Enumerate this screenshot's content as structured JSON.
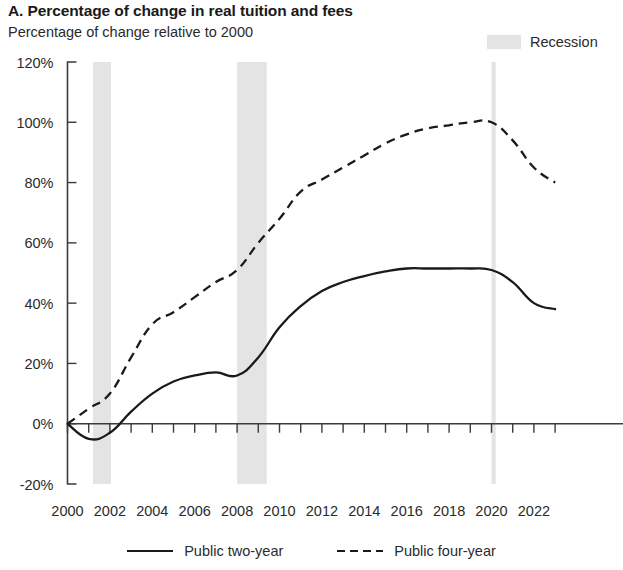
{
  "header": {
    "title": "A. Percentage of change in real tuition and fees",
    "subtitle": "Percentage of change relative to 2000"
  },
  "recession_legend": {
    "label": "Recession",
    "swatch_color": "#e4e4e4"
  },
  "legend": {
    "entries": [
      {
        "label": "Public two-year",
        "style": "solid",
        "color": "#1a1a1a"
      },
      {
        "label": "Public four-year",
        "style": "dashed",
        "color": "#1a1a1a"
      }
    ]
  },
  "chart_data": {
    "type": "line",
    "title": "A. Percentage of change in real tuition and fees",
    "subtitle": "Percentage of change relative to 2000",
    "xlabel": "",
    "ylabel": "Percentage of change relative to 2000",
    "ylim": [
      -20,
      120
    ],
    "xlim": [
      2000,
      2023
    ],
    "grid": false,
    "legend_position": "bottom",
    "y_tick_labels": [
      "120%",
      "100%",
      "80%",
      "60%",
      "40%",
      "20%",
      "0%",
      "-20%"
    ],
    "y_tick_values": [
      120,
      100,
      80,
      60,
      40,
      20,
      0,
      -20
    ],
    "x_tick_labels": [
      "2000",
      "2002",
      "2004",
      "2006",
      "2008",
      "2010",
      "2012",
      "2014",
      "2016",
      "2018",
      "2020",
      "2022"
    ],
    "x_tick_values": [
      2000,
      2002,
      2004,
      2006,
      2008,
      2010,
      2012,
      2014,
      2016,
      2018,
      2020,
      2022
    ],
    "x_minor_tick_values": [
      2000,
      2001,
      2002,
      2003,
      2004,
      2005,
      2006,
      2007,
      2008,
      2009,
      2010,
      2011,
      2012,
      2013,
      2014,
      2015,
      2016,
      2017,
      2018,
      2019,
      2020,
      2021,
      2022,
      2023
    ],
    "x": [
      2000,
      2001,
      2002,
      2003,
      2004,
      2005,
      2006,
      2007,
      2008,
      2009,
      2010,
      2011,
      2012,
      2013,
      2014,
      2015,
      2016,
      2017,
      2018,
      2019,
      2020,
      2021,
      2022,
      2023
    ],
    "series": [
      {
        "name": "Public two-year",
        "style": "solid",
        "color": "#1a1a1a",
        "values": [
          0,
          -5,
          -3,
          4,
          10,
          14,
          16,
          17,
          16,
          22,
          32,
          39,
          44,
          47,
          49,
          50.5,
          51.5,
          51.5,
          51.5,
          51.5,
          51,
          47,
          40,
          38
        ]
      },
      {
        "name": "Public four-year",
        "style": "dashed",
        "color": "#1a1a1a",
        "values": [
          0,
          5,
          10,
          22,
          33,
          37,
          42,
          47,
          51,
          60,
          68,
          77,
          81,
          85,
          89,
          93,
          96,
          98,
          99,
          100,
          100,
          94,
          85,
          80
        ]
      }
    ],
    "shaded_regions": [
      {
        "name": "Recession",
        "start": 2001.2,
        "end": 2002.05,
        "color": "#e4e4e4"
      },
      {
        "name": "Recession",
        "start": 2008.0,
        "end": 2009.4,
        "color": "#e4e4e4"
      },
      {
        "name": "Recession",
        "start": 2020.0,
        "end": 2020.2,
        "color": "#e4e4e4"
      }
    ]
  }
}
